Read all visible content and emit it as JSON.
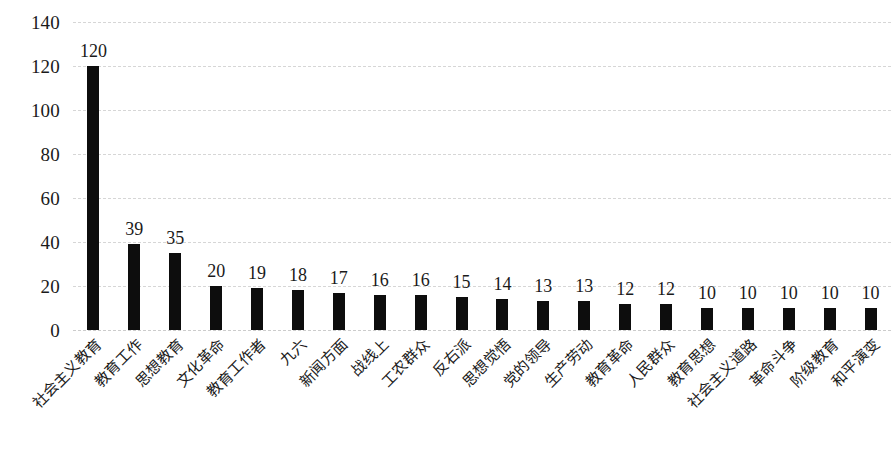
{
  "chart_data": {
    "type": "bar",
    "title": "",
    "subtitle": "",
    "xlabel": "",
    "ylabel": "",
    "ylim": [
      0,
      140
    ],
    "y_ticks": [
      0,
      20,
      40,
      60,
      80,
      100,
      120,
      140
    ],
    "grid": true,
    "legend": false,
    "legend_position": "none",
    "bar_color": "#0d0d0d",
    "gridline_color": "#d6d6d6",
    "data_labels": true,
    "categories": [
      "社会主义教育",
      "教育工作",
      "思想教育",
      "文化革命",
      "教育工作者",
      "九六",
      "新闻方面",
      "战线上",
      "工农群众",
      "反右派",
      "思想觉悟",
      "党的领导",
      "生产劳动",
      "教育革命",
      "人民群众",
      "教育思想",
      "社会主义道路",
      "革命斗争",
      "阶级教育",
      "和平演变"
    ],
    "values": [
      120,
      39,
      35,
      20,
      19,
      18,
      17,
      16,
      16,
      15,
      14,
      13,
      13,
      12,
      12,
      10,
      10,
      10,
      10,
      10
    ]
  }
}
